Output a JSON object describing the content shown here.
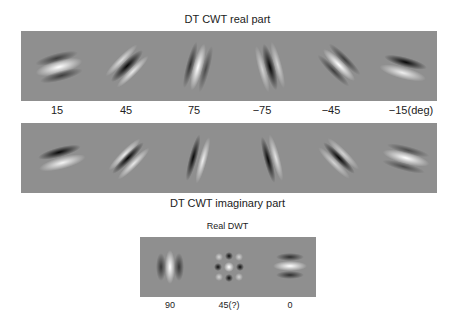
{
  "figure": {
    "top_title": "DT CWT real part",
    "middle_title": "DT CWT imaginary part",
    "bottom_title": "Real DWT",
    "dtcwt_angle_labels": [
      "15",
      "45",
      "75",
      "−75",
      "−45",
      "−15(deg)"
    ],
    "dwt_angle_labels": [
      "90",
      "45(?)",
      "0"
    ]
  }
}
